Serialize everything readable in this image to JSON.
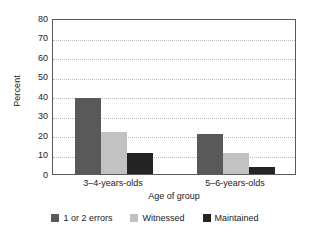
{
  "chart_data": {
    "type": "bar",
    "title": "",
    "subtitle": "",
    "xlabel": "Age of group",
    "ylabel": "Percent",
    "categories": [
      "3–4-years-olds",
      "5–6-years-olds"
    ],
    "series": [
      {
        "name": "1 or 2 errors",
        "color": "#595959",
        "values": [
          39,
          20.5
        ]
      },
      {
        "name": "Witnessed",
        "color": "#c2c2c2",
        "values": [
          21.5,
          11
        ]
      },
      {
        "name": "Maintained",
        "color": "#242424",
        "values": [
          10.8,
          3.5
        ]
      }
    ],
    "ylim": [
      0,
      80
    ],
    "yticks": [
      0,
      10,
      20,
      30,
      40,
      50,
      60,
      70,
      80
    ],
    "ytick_labels": [
      "0",
      "10",
      "20",
      "30",
      "40",
      "50",
      "60",
      "70",
      "80"
    ],
    "grid": true,
    "grid_style": "dotted-horizontal",
    "legend_position": "bottom-center",
    "frame_color": "#555a5e",
    "background": "#ffffff"
  },
  "axes": {
    "y_title": "Percent",
    "x_title": "Age of group"
  }
}
